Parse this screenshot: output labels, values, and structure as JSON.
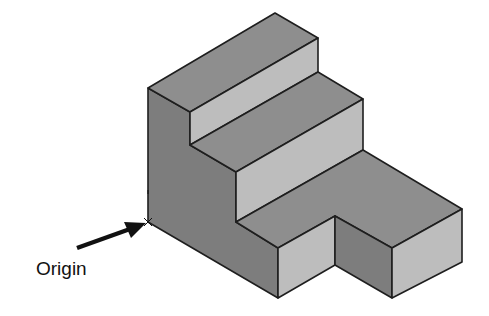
{
  "figure": {
    "label": "Origin",
    "colors": {
      "top_face": "#8e8e8e",
      "light_face": "#b9b9b9",
      "dark_face": "#7d7d7d",
      "edge": "#1e1e1e",
      "arrow": "#111111"
    }
  }
}
